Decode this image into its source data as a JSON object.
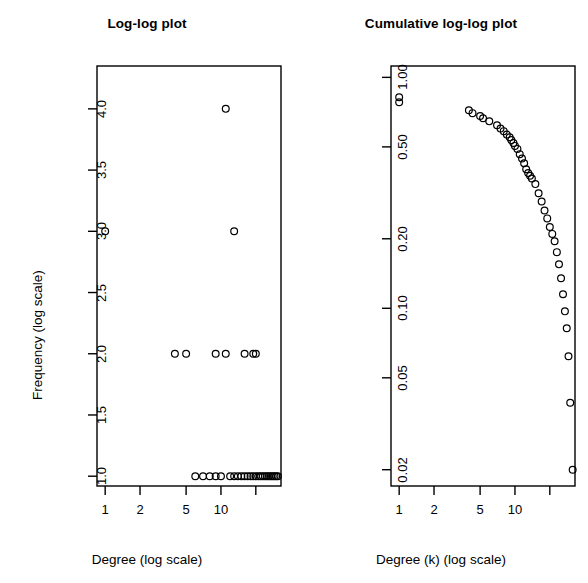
{
  "figure": {
    "background_color": "#ffffff",
    "foreground_color": "#000000",
    "panels": 2
  },
  "chart_data": [
    {
      "type": "scatter",
      "panel": "left",
      "title": "Log-log plot",
      "xlabel": "Degree (log scale)",
      "ylabel": "Frequency (log scale)",
      "xscale": "log",
      "yscale": "log",
      "grid": false,
      "legend": null,
      "marker": "open-circle",
      "xtick_values": [
        1,
        2,
        5,
        10,
        20
      ],
      "xtick_labels": [
        "1",
        "2",
        "5",
        "10",
        ""
      ],
      "ytick_values": [
        1.0,
        1.5,
        2.0,
        2.5,
        3.0,
        3.5,
        4.0
      ],
      "ytick_labels": [
        "1.0",
        "1.5",
        "2.0",
        "2.5",
        "3.0",
        "3.5",
        "4.0"
      ],
      "xlim": [
        0.85,
        33
      ],
      "ylim": [
        0.92,
        4.35
      ],
      "points": [
        {
          "x": 1,
          "y": 3
        },
        {
          "x": 4,
          "y": 2
        },
        {
          "x": 5,
          "y": 2
        },
        {
          "x": 6,
          "y": 1
        },
        {
          "x": 7,
          "y": 1
        },
        {
          "x": 8,
          "y": 1
        },
        {
          "x": 9,
          "y": 2
        },
        {
          "x": 9,
          "y": 1
        },
        {
          "x": 10,
          "y": 1
        },
        {
          "x": 11,
          "y": 4
        },
        {
          "x": 11,
          "y": 2
        },
        {
          "x": 12,
          "y": 1
        },
        {
          "x": 13,
          "y": 3
        },
        {
          "x": 13,
          "y": 1
        },
        {
          "x": 14,
          "y": 1
        },
        {
          "x": 15,
          "y": 1
        },
        {
          "x": 16,
          "y": 2
        },
        {
          "x": 16,
          "y": 1
        },
        {
          "x": 17,
          "y": 1
        },
        {
          "x": 18,
          "y": 1
        },
        {
          "x": 19,
          "y": 2
        },
        {
          "x": 19,
          "y": 1
        },
        {
          "x": 20,
          "y": 2
        },
        {
          "x": 20,
          "y": 1
        },
        {
          "x": 21,
          "y": 1
        },
        {
          "x": 22,
          "y": 1
        },
        {
          "x": 23,
          "y": 1
        },
        {
          "x": 24,
          "y": 1
        },
        {
          "x": 25,
          "y": 1
        },
        {
          "x": 26,
          "y": 1
        },
        {
          "x": 27,
          "y": 1
        },
        {
          "x": 28,
          "y": 1
        },
        {
          "x": 29,
          "y": 1
        },
        {
          "x": 30,
          "y": 1
        },
        {
          "x": 31,
          "y": 1
        }
      ]
    },
    {
      "type": "scatter",
      "panel": "right",
      "title": "Cumulative log-log plot",
      "xlabel": "Degree (k) (log scale)",
      "ylabel": "Fraction with min. degree k (log scale)",
      "xscale": "log",
      "yscale": "log",
      "grid": false,
      "legend": null,
      "marker": "open-circle",
      "xtick_values": [
        1,
        2,
        5,
        10,
        20
      ],
      "xtick_labels": [
        "1",
        "2",
        "5",
        "10",
        ""
      ],
      "ytick_values": [
        0.02,
        0.05,
        0.1,
        0.2,
        0.5,
        1.0
      ],
      "ytick_labels": [
        "0.02",
        "0.05",
        "0.10",
        "0.20",
        "0.50",
        "1.00"
      ],
      "xlim": [
        0.85,
        33
      ],
      "ylim": [
        0.017,
        1.12
      ],
      "points": [
        {
          "x": 1,
          "y": 0.82
        },
        {
          "x": 1,
          "y": 0.78
        },
        {
          "x": 4,
          "y": 0.72
        },
        {
          "x": 4.3,
          "y": 0.7
        },
        {
          "x": 5,
          "y": 0.68
        },
        {
          "x": 5.3,
          "y": 0.665
        },
        {
          "x": 6,
          "y": 0.645
        },
        {
          "x": 7,
          "y": 0.62
        },
        {
          "x": 7.5,
          "y": 0.6
        },
        {
          "x": 8,
          "y": 0.585
        },
        {
          "x": 8.5,
          "y": 0.565
        },
        {
          "x": 9,
          "y": 0.55
        },
        {
          "x": 9.3,
          "y": 0.535
        },
        {
          "x": 9.7,
          "y": 0.52
        },
        {
          "x": 10,
          "y": 0.505
        },
        {
          "x": 10.5,
          "y": 0.49
        },
        {
          "x": 11,
          "y": 0.465
        },
        {
          "x": 11.5,
          "y": 0.445
        },
        {
          "x": 12,
          "y": 0.425
        },
        {
          "x": 12.5,
          "y": 0.4
        },
        {
          "x": 13,
          "y": 0.385
        },
        {
          "x": 13.5,
          "y": 0.375
        },
        {
          "x": 14,
          "y": 0.365
        },
        {
          "x": 15,
          "y": 0.345
        },
        {
          "x": 16,
          "y": 0.315
        },
        {
          "x": 17,
          "y": 0.29
        },
        {
          "x": 18,
          "y": 0.265
        },
        {
          "x": 19,
          "y": 0.245
        },
        {
          "x": 20,
          "y": 0.225
        },
        {
          "x": 21,
          "y": 0.21
        },
        {
          "x": 22,
          "y": 0.195
        },
        {
          "x": 23,
          "y": 0.175
        },
        {
          "x": 24,
          "y": 0.155
        },
        {
          "x": 25,
          "y": 0.135
        },
        {
          "x": 26,
          "y": 0.115
        },
        {
          "x": 27,
          "y": 0.097
        },
        {
          "x": 28,
          "y": 0.082
        },
        {
          "x": 29,
          "y": 0.062
        },
        {
          "x": 30,
          "y": 0.039
        },
        {
          "x": 31.5,
          "y": 0.02
        }
      ]
    }
  ]
}
